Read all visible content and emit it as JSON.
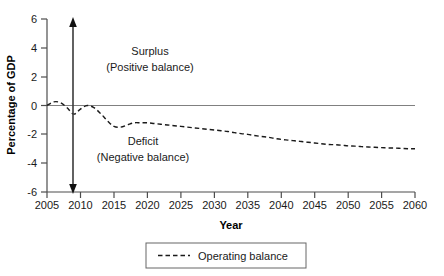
{
  "chart_data": {
    "type": "line",
    "title": "",
    "xlabel": "Year",
    "ylabel": "Percentage of GDP",
    "xlim": [
      2005,
      2060
    ],
    "ylim": [
      -6,
      6
    ],
    "grid": false,
    "legend_position": "bottom-center",
    "x_ticks": [
      2005,
      2010,
      2015,
      2020,
      2025,
      2030,
      2035,
      2040,
      2045,
      2050,
      2055,
      2060
    ],
    "y_ticks": [
      6,
      4,
      2,
      0,
      -2,
      -4,
      -6
    ],
    "x_tick_labels": [
      "2005",
      "2010",
      "2015",
      "2020",
      "2025",
      "2030",
      "2035",
      "2040",
      "2045",
      "2050",
      "2055",
      "2060"
    ],
    "y_tick_labels": [
      "6",
      "4",
      "2",
      "0",
      "-2",
      "-4",
      "-6"
    ],
    "series": [
      {
        "name": "Operating balance",
        "style": "dashed",
        "color": "#1a1a1a",
        "x": [
          2005,
          2006,
          2007,
          2008,
          2009,
          2010,
          2011,
          2012,
          2013,
          2014,
          2015,
          2016,
          2017,
          2018,
          2019,
          2020,
          2021,
          2022,
          2023,
          2024,
          2025,
          2026,
          2027,
          2028,
          2029,
          2030,
          2031,
          2032,
          2033,
          2034,
          2035,
          2036,
          2037,
          2038,
          2039,
          2040,
          2041,
          2042,
          2043,
          2044,
          2045,
          2046,
          2047,
          2048,
          2049,
          2050,
          2051,
          2052,
          2053,
          2054,
          2055,
          2056,
          2057,
          2058,
          2059,
          2060
        ],
        "values": [
          0.0,
          0.25,
          0.2,
          -0.15,
          -0.6,
          -0.25,
          0.0,
          -0.15,
          -0.55,
          -1.05,
          -1.45,
          -1.5,
          -1.35,
          -1.2,
          -1.2,
          -1.2,
          -1.25,
          -1.3,
          -1.35,
          -1.4,
          -1.45,
          -1.5,
          -1.55,
          -1.6,
          -1.65,
          -1.7,
          -1.75,
          -1.8,
          -1.88,
          -1.95,
          -2.0,
          -2.08,
          -2.15,
          -2.2,
          -2.28,
          -2.35,
          -2.4,
          -2.45,
          -2.5,
          -2.55,
          -2.6,
          -2.65,
          -2.7,
          -2.72,
          -2.75,
          -2.8,
          -2.82,
          -2.85,
          -2.88,
          -2.9,
          -2.92,
          -2.95,
          -2.95,
          -2.98,
          -3.0,
          -3.0
        ]
      }
    ],
    "reference_line": {
      "name": "zero-line",
      "y": 0
    },
    "annotations": [
      {
        "id": "surplus",
        "line1": "Surplus",
        "line2": "(Positive balance)",
        "region": "above-zero"
      },
      {
        "id": "deficit",
        "line1": "Deficit",
        "line2": "(Negative balance)",
        "region": "below-zero"
      }
    ],
    "range_arrow": {
      "name": "balance-range-arrow",
      "x": 2009,
      "y_top": 6,
      "y_bottom": -6,
      "double_headed": true
    }
  },
  "legend": {
    "entries": [
      {
        "label": "Operating balance",
        "style": "dashed",
        "color": "#1a1a1a"
      }
    ]
  }
}
